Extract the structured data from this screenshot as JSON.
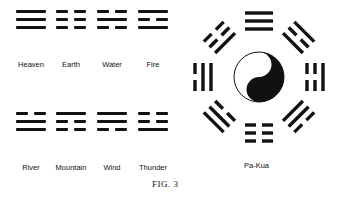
{
  "figure": {
    "caption": "FIG. 3",
    "trigrams_top": [
      {
        "name": "Heaven",
        "lines": [
          1,
          1,
          1
        ]
      },
      {
        "name": "Earth",
        "lines": [
          0,
          0,
          0
        ]
      },
      {
        "name": "Water",
        "lines": [
          0,
          1,
          0
        ]
      },
      {
        "name": "Fire",
        "lines": [
          1,
          0,
          1
        ]
      }
    ],
    "trigrams_bottom": [
      {
        "name": "River",
        "lines": [
          0,
          1,
          1
        ]
      },
      {
        "name": "Mountain",
        "lines": [
          1,
          0,
          0
        ]
      },
      {
        "name": "Wind",
        "lines": [
          1,
          1,
          0
        ]
      },
      {
        "name": "Thunder",
        "lines": [
          0,
          0,
          1
        ]
      }
    ],
    "pakua": {
      "label": "Pa-Kua",
      "center_symbol": "yin-yang",
      "positions": {
        "top": [
          1,
          1,
          1
        ],
        "top_right": [
          1,
          0,
          1
        ],
        "right": [
          1,
          0,
          0
        ],
        "bottom_right": [
          0,
          1,
          1
        ],
        "bottom": [
          0,
          0,
          0
        ],
        "bottom_left": [
          1,
          1,
          0
        ],
        "left": [
          0,
          1,
          1
        ],
        "top_left": [
          0,
          0,
          1
        ]
      }
    }
  }
}
